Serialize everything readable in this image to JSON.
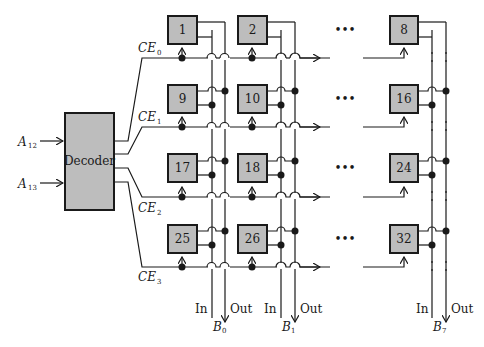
{
  "diagram": {
    "decoder": {
      "label": "Decoder",
      "inputs": [
        {
          "name": "A",
          "sub": "12"
        },
        {
          "name": "A",
          "sub": "13"
        }
      ]
    },
    "chip_enable_lines": [
      {
        "name": "CE",
        "sub": "0"
      },
      {
        "name": "CE",
        "sub": "1"
      },
      {
        "name": "CE",
        "sub": "2"
      },
      {
        "name": "CE",
        "sub": "3"
      }
    ],
    "rows": [
      [
        "1",
        "2",
        "8"
      ],
      [
        "9",
        "10",
        "16"
      ],
      [
        "17",
        "18",
        "24"
      ],
      [
        "25",
        "26",
        "32"
      ]
    ],
    "ellipsis": "•••",
    "bit_columns": [
      {
        "in_label": "In",
        "out_label": "Out",
        "bus": "B",
        "sub": "0"
      },
      {
        "in_label": "In",
        "out_label": "Out",
        "bus": "B",
        "sub": "1"
      },
      {
        "in_label": "In",
        "out_label": "Out",
        "bus": "B",
        "sub": "7"
      }
    ]
  }
}
